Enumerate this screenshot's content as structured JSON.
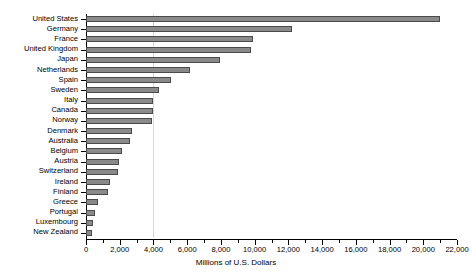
{
  "chart_data": {
    "type": "bar",
    "orientation": "horizontal",
    "title": "",
    "xlabel": "Millions of U.S. Dollars",
    "ylabel": "",
    "xlim": [
      0,
      22000
    ],
    "grid": false,
    "legend": null,
    "xticks": [
      0,
      2000,
      4000,
      6000,
      8000,
      10000,
      12000,
      14000,
      16000,
      18000,
      20000,
      22000
    ],
    "xtick_labels": [
      "0",
      "2,000",
      "4,000",
      "6,000",
      "8,000",
      "10,000",
      "12,000",
      "14,000",
      "16,000",
      "18,000",
      "20,000",
      "22,000"
    ],
    "minor_tick_interval": 1000,
    "categories": [
      "United States",
      "Germany",
      "France",
      "United Kingdom",
      "Japan",
      "Netherlands",
      "Spain",
      "Sweden",
      "Italy",
      "Canada",
      "Norway",
      "Denmark",
      "Australia",
      "Belgium",
      "Austria",
      "Switzerland",
      "Ireland",
      "Finland",
      "Greece",
      "Portugal",
      "Luxembourg",
      "New Zealand"
    ],
    "values": [
      21000,
      12200,
      9900,
      9800,
      7950,
      6150,
      5050,
      4350,
      4000,
      3950,
      3900,
      2750,
      2600,
      2150,
      1980,
      1900,
      1450,
      1300,
      700,
      560,
      420,
      360
    ],
    "bar_color": "#8a8a8a",
    "bar_edge_color": "#4a4a4a",
    "axis_color": "#000000",
    "background_color": "#ffffff"
  }
}
